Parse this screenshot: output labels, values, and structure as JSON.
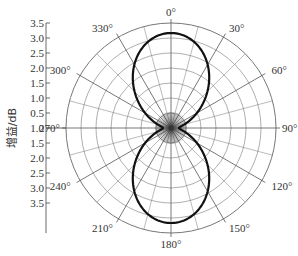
{
  "chart_data": {
    "type": "polar",
    "title": "",
    "ylabel": "增益/dB",
    "radial_ticks": [
      "3.5",
      "3.0",
      "2.5",
      "2.0",
      "1.5",
      "1.0",
      "0.5",
      "1.0",
      "1.5",
      "2.0",
      "2.5",
      "3.0",
      "3.5"
    ],
    "radial_range": [
      0.5,
      3.5
    ],
    "radial_step": 0.5,
    "angle_labels": [
      "0°",
      "30°",
      "60°",
      "90°",
      "120°",
      "150°",
      "180°",
      "210°",
      "240°",
      "270°",
      "300°",
      "330°"
    ],
    "angle_grid_step_deg": 15,
    "grid": true,
    "series": [
      {
        "name": "gain pattern",
        "shape": "figure-eight (cos² lobes toward 0° and 180°, null near 90°/270°)",
        "theta_deg": [
          0,
          15,
          30,
          45,
          60,
          75,
          90,
          105,
          120,
          135,
          150,
          165,
          180
        ],
        "gain_dB": [
          3.2,
          3.0,
          2.5,
          2.0,
          1.4,
          0.9,
          0.8,
          0.9,
          1.4,
          2.0,
          2.5,
          3.0,
          3.2
        ]
      }
    ],
    "colors": {
      "curve": "#111111",
      "grid": "#777777",
      "axis": "#444444"
    }
  }
}
